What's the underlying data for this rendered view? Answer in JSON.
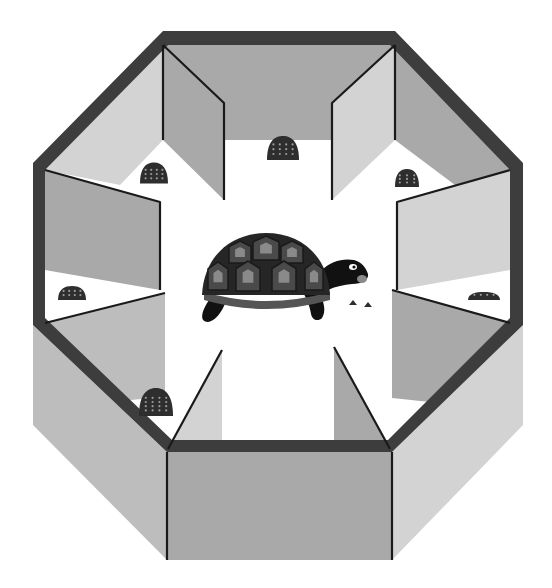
{
  "illustration": {
    "subject": "tortoise in octagonal maze",
    "width": 552,
    "height": 588,
    "colors": {
      "background": "#ffffff",
      "rim": "#3d3d3d",
      "wall_dark": "#a9a9a9",
      "wall_mid": "#bdbdbd",
      "wall_light": "#d3d3d3",
      "floor": "#ffffff",
      "edge_line": "#1a1a1a",
      "rock": "#2e2e2e",
      "rock_dot": "#9a9a9a",
      "shell": "#262626",
      "shell_scute": "#4a4a4a",
      "shell_inner": "#8a8a8a",
      "shell_rim": "#555555",
      "body": "#111111",
      "eye": "#ffffff"
    },
    "outer_walls": [
      {
        "name": "front-left-outer-wall",
        "points": "33,325 167,452 167,560 33,425",
        "fill": "wall_mid"
      },
      {
        "name": "front-outer-wall",
        "points": "167,452 392,452 392,560 167,560",
        "fill": "wall_dark"
      },
      {
        "name": "front-right-outer-wall",
        "points": "392,452 523,325 523,425 392,560",
        "fill": "wall_light"
      }
    ],
    "inner_wall_faces": [
      {
        "name": "back-inner-wall",
        "points": "163,45 395,45 395,140 163,140",
        "fill": "wall_dark"
      },
      {
        "name": "back-left-inner-wall",
        "points": "45,170 163,45 163,140 120,185",
        "fill": "wall_light"
      },
      {
        "name": "back-right-inner-wall",
        "points": "395,45 510,170 455,185 395,140",
        "fill": "wall_dark"
      },
      {
        "name": "left-inner-wall-upper",
        "points": "45,170 160,202 160,290 45,270",
        "fill": "wall_dark"
      },
      {
        "name": "right-inner-wall-upper",
        "points": "510,170 397,202 397,290 510,270",
        "fill": "wall_light"
      },
      {
        "name": "left-lower-floor-wall",
        "points": "45,323 165,293 165,397 130,400",
        "fill": "wall_mid"
      },
      {
        "name": "right-lower-floor-wall",
        "points": "510,323 392,290 392,398 430,402",
        "fill": "wall_dark"
      }
    ],
    "dividers": [
      {
        "name": "divider-top-left",
        "points": "163,45 224,103 224,200 163,140",
        "fill": "wall_dark"
      },
      {
        "name": "divider-top-right",
        "points": "395,45 332,103 332,200 395,140",
        "fill": "wall_light"
      },
      {
        "name": "divider-bottom-left",
        "points": "222,350 222,449 168,449",
        "fill": "wall_light"
      },
      {
        "name": "divider-bottom-right",
        "points": "334,347 334,449 390,449",
        "fill": "wall_dark"
      }
    ],
    "divider_edges": [
      {
        "name": "divider-edge-top-left",
        "d": "M163,45 L224,103 L224,200"
      },
      {
        "name": "divider-edge-top-right",
        "d": "M395,45 L332,103 L332,200"
      },
      {
        "name": "divider-edge-left-upper",
        "d": "M45,170 L160,202 L160,290"
      },
      {
        "name": "divider-edge-right-upper",
        "d": "M510,170 L397,202 L397,290"
      },
      {
        "name": "divider-edge-left-lower",
        "d": "M45,323 L165,293"
      },
      {
        "name": "divider-edge-right-lower",
        "d": "M510,323 L392,290"
      },
      {
        "name": "divider-edge-bottom-left",
        "d": "M168,449 L222,350"
      },
      {
        "name": "divider-edge-bottom-right",
        "d": "M390,449 L334,347"
      },
      {
        "name": "corner-edge-top-left",
        "d": "M163,45 L163,140"
      },
      {
        "name": "corner-edge-top-right",
        "d": "M395,45 L395,140"
      },
      {
        "name": "corner-edge-front-left",
        "d": "M167,452 L167,560"
      },
      {
        "name": "corner-edge-front-right",
        "d": "M392,452 L392,560"
      }
    ],
    "rim": {
      "outer": "163,31 395,31 523,163 523,325 392,452 167,452 33,325 33,163",
      "inner": "168,45 390,45 510,170 510,318 388,440 172,440 45,318 45,170"
    },
    "rocks": [
      {
        "name": "rock-top-center",
        "cx": 283,
        "cy": 148,
        "w": 32,
        "h": 24
      },
      {
        "name": "rock-top-left",
        "cx": 154,
        "cy": 173,
        "w": 28,
        "h": 21
      },
      {
        "name": "rock-top-right",
        "cx": 407,
        "cy": 178,
        "w": 24,
        "h": 18
      },
      {
        "name": "rock-left",
        "cx": 72,
        "cy": 293,
        "w": 28,
        "h": 14
      },
      {
        "name": "rock-bottom-left",
        "cx": 156,
        "cy": 402,
        "w": 34,
        "h": 28
      },
      {
        "name": "rock-right",
        "cx": 484,
        "cy": 296,
        "w": 32,
        "h": 8
      }
    ],
    "pellets": [
      {
        "name": "pellet-1",
        "cx": 353,
        "cy": 303
      },
      {
        "name": "pellet-2",
        "cx": 368,
        "cy": 305
      }
    ],
    "tortoise": {
      "shell_center_x": 266,
      "shell_base_y": 295,
      "shell_radius_x": 64,
      "shell_radius_y": 63,
      "head_x": 352,
      "head_y": 270
    }
  }
}
